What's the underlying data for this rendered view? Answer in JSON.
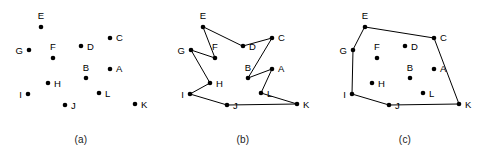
{
  "figure": {
    "background_color": "#ffffff",
    "ink_color": "#000000",
    "panel_width": 162,
    "panel_height": 165,
    "plot_height": 135,
    "dot_radius": 2.3,
    "label_font_size": 9.5
  },
  "points": [
    {
      "id": "A",
      "x": 110,
      "y": 69,
      "label": "A",
      "lx": 116,
      "ly": 72,
      "anchor": "start"
    },
    {
      "id": "B",
      "x": 86,
      "y": 78,
      "label": "B",
      "lx": 86,
      "ly": 71,
      "anchor": "middle"
    },
    {
      "id": "C",
      "x": 110,
      "y": 38,
      "label": "C",
      "lx": 116,
      "ly": 41,
      "anchor": "start"
    },
    {
      "id": "D",
      "x": 81,
      "y": 46,
      "label": "D",
      "lx": 87,
      "ly": 49.5,
      "anchor": "start"
    },
    {
      "id": "E",
      "x": 41,
      "y": 27,
      "label": "E",
      "lx": 41,
      "ly": 19,
      "anchor": "middle"
    },
    {
      "id": "F",
      "x": 53,
      "y": 58,
      "label": "F",
      "lx": 53,
      "ly": 50,
      "anchor": "middle"
    },
    {
      "id": "G",
      "x": 29,
      "y": 50,
      "label": "G",
      "lx": 23,
      "ly": 53.5,
      "anchor": "end"
    },
    {
      "id": "H",
      "x": 48,
      "y": 83,
      "label": "H",
      "lx": 54,
      "ly": 86.5,
      "anchor": "start"
    },
    {
      "id": "I",
      "x": 28,
      "y": 94,
      "label": "I",
      "lx": 22,
      "ly": 97.5,
      "anchor": "end"
    },
    {
      "id": "J",
      "x": 65,
      "y": 105,
      "label": "J",
      "lx": 71,
      "ly": 108.5,
      "anchor": "start"
    },
    {
      "id": "K",
      "x": 135,
      "y": 104,
      "label": "K",
      "lx": 141,
      "ly": 107.5,
      "anchor": "start"
    },
    {
      "id": "L",
      "x": 99,
      "y": 93,
      "label": "L",
      "lx": 105,
      "ly": 96.5,
      "anchor": "start"
    }
  ],
  "panels": [
    {
      "id": "a",
      "caption": "(a)",
      "name": "point-set-panel",
      "description": "scattered points, no edges",
      "polygon": []
    },
    {
      "id": "b",
      "caption": "(b)",
      "name": "simple-polygon-panel",
      "description": "non-convex simple polygon through all points",
      "polygon": [
        "E",
        "F",
        "G",
        "H",
        "I",
        "J",
        "K",
        "L",
        "A",
        "B",
        "C",
        "D"
      ]
    },
    {
      "id": "c",
      "caption": "(c)",
      "name": "convex-hull-panel",
      "description": "convex hull of the point set",
      "polygon": [
        "E",
        "C",
        "K",
        "J",
        "I",
        "G"
      ]
    }
  ]
}
